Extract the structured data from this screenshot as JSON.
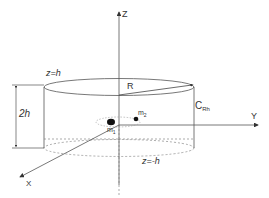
{
  "diagram": {
    "axes": {
      "z": "Z",
      "y": "Y",
      "x": "X"
    },
    "labels": {
      "top_plane": "z=h",
      "bottom_plane": "z=-h",
      "radius": "R",
      "height": "2h",
      "cylinder": "C",
      "cylinder_sub": "Rh",
      "mass1": "m",
      "mass1_sub": "1",
      "mass2": "m",
      "mass2_sub": "2"
    },
    "colors": {
      "line": "#444444",
      "dashed": "#888888",
      "mass": "#111111"
    }
  }
}
